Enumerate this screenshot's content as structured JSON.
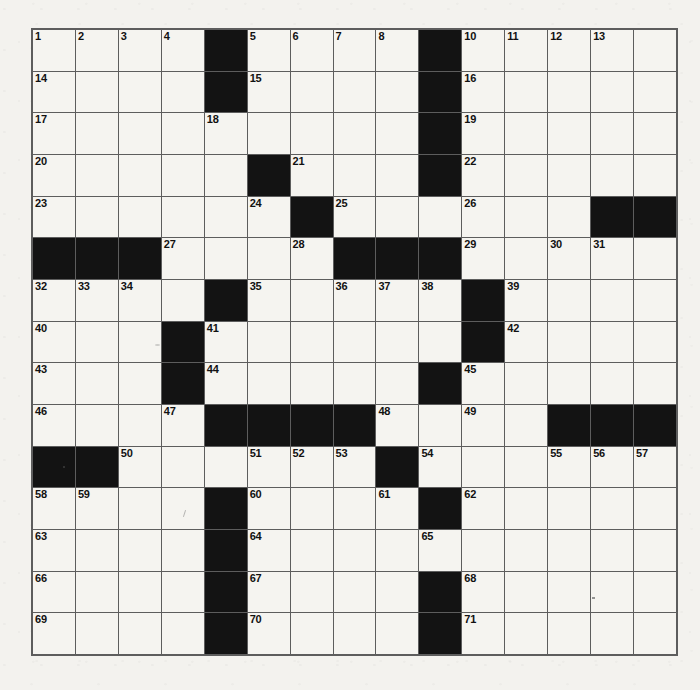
{
  "puzzle": {
    "name": "crossword-grid",
    "type": "crossword",
    "rows": 15,
    "cols": 15,
    "colors": {
      "block": "#131313",
      "cell": "#f5f4f0",
      "grid_line": "#5d5d5d",
      "paper": "#f3f2ee",
      "number_text": "#111111"
    },
    "blocks": [
      [
        0,
        4
      ],
      [
        0,
        9
      ],
      [
        1,
        4
      ],
      [
        1,
        9
      ],
      [
        2,
        9
      ],
      [
        3,
        5
      ],
      [
        3,
        9
      ],
      [
        4,
        6
      ],
      [
        4,
        13
      ],
      [
        4,
        14
      ],
      [
        5,
        0
      ],
      [
        5,
        1
      ],
      [
        5,
        2
      ],
      [
        5,
        7
      ],
      [
        5,
        8
      ],
      [
        5,
        9
      ],
      [
        6,
        4
      ],
      [
        6,
        10
      ],
      [
        7,
        3
      ],
      [
        7,
        10
      ],
      [
        8,
        3
      ],
      [
        8,
        9
      ],
      [
        9,
        4
      ],
      [
        9,
        5
      ],
      [
        9,
        6
      ],
      [
        9,
        7
      ],
      [
        9,
        12
      ],
      [
        9,
        13
      ],
      [
        9,
        14
      ],
      [
        10,
        0
      ],
      [
        10,
        1
      ],
      [
        10,
        8
      ],
      [
        11,
        4
      ],
      [
        11,
        9
      ],
      [
        12,
        4
      ],
      [
        13,
        4
      ],
      [
        13,
        9
      ],
      [
        14,
        4
      ],
      [
        14,
        9
      ]
    ],
    "numbers": [
      {
        "r": 0,
        "c": 0,
        "n": "1"
      },
      {
        "r": 0,
        "c": 1,
        "n": "2"
      },
      {
        "r": 0,
        "c": 2,
        "n": "3"
      },
      {
        "r": 0,
        "c": 3,
        "n": "4"
      },
      {
        "r": 0,
        "c": 5,
        "n": "5"
      },
      {
        "r": 0,
        "c": 6,
        "n": "6"
      },
      {
        "r": 0,
        "c": 7,
        "n": "7"
      },
      {
        "r": 0,
        "c": 8,
        "n": "8"
      },
      {
        "r": 0,
        "c": 9,
        "n": "9"
      },
      {
        "r": 0,
        "c": 10,
        "n": "10"
      },
      {
        "r": 0,
        "c": 11,
        "n": "11"
      },
      {
        "r": 0,
        "c": 12,
        "n": "12"
      },
      {
        "r": 0,
        "c": 13,
        "n": "13"
      },
      {
        "r": 1,
        "c": 0,
        "n": "14"
      },
      {
        "r": 1,
        "c": 5,
        "n": "15"
      },
      {
        "r": 1,
        "c": 10,
        "n": "16"
      },
      {
        "r": 2,
        "c": 0,
        "n": "17"
      },
      {
        "r": 2,
        "c": 4,
        "n": "18"
      },
      {
        "r": 2,
        "c": 10,
        "n": "19"
      },
      {
        "r": 3,
        "c": 0,
        "n": "20"
      },
      {
        "r": 3,
        "c": 6,
        "n": "21"
      },
      {
        "r": 3,
        "c": 10,
        "n": "22"
      },
      {
        "r": 4,
        "c": 0,
        "n": "23"
      },
      {
        "r": 4,
        "c": 5,
        "n": "24"
      },
      {
        "r": 4,
        "c": 7,
        "n": "25"
      },
      {
        "r": 4,
        "c": 10,
        "n": "26"
      },
      {
        "r": 5,
        "c": 3,
        "n": "27"
      },
      {
        "r": 5,
        "c": 6,
        "n": "28"
      },
      {
        "r": 5,
        "c": 10,
        "n": "29"
      },
      {
        "r": 5,
        "c": 12,
        "n": "30"
      },
      {
        "r": 5,
        "c": 13,
        "n": "31"
      },
      {
        "r": 6,
        "c": 0,
        "n": "32"
      },
      {
        "r": 6,
        "c": 1,
        "n": "33"
      },
      {
        "r": 6,
        "c": 2,
        "n": "34"
      },
      {
        "r": 6,
        "c": 5,
        "n": "35"
      },
      {
        "r": 6,
        "c": 7,
        "n": "36"
      },
      {
        "r": 6,
        "c": 8,
        "n": "37"
      },
      {
        "r": 6,
        "c": 9,
        "n": "38"
      },
      {
        "r": 6,
        "c": 11,
        "n": "39"
      },
      {
        "r": 7,
        "c": 0,
        "n": "40"
      },
      {
        "r": 7,
        "c": 4,
        "n": "41"
      },
      {
        "r": 7,
        "c": 11,
        "n": "42"
      },
      {
        "r": 8,
        "c": 0,
        "n": "43"
      },
      {
        "r": 8,
        "c": 4,
        "n": "44"
      },
      {
        "r": 8,
        "c": 10,
        "n": "45"
      },
      {
        "r": 9,
        "c": 0,
        "n": "46"
      },
      {
        "r": 9,
        "c": 3,
        "n": "47"
      },
      {
        "r": 9,
        "c": 8,
        "n": "48"
      },
      {
        "r": 9,
        "c": 10,
        "n": "49"
      },
      {
        "r": 10,
        "c": 2,
        "n": "50"
      },
      {
        "r": 10,
        "c": 5,
        "n": "51"
      },
      {
        "r": 10,
        "c": 6,
        "n": "52"
      },
      {
        "r": 10,
        "c": 7,
        "n": "53"
      },
      {
        "r": 10,
        "c": 9,
        "n": "54"
      },
      {
        "r": 10,
        "c": 12,
        "n": "55"
      },
      {
        "r": 10,
        "c": 13,
        "n": "56"
      },
      {
        "r": 10,
        "c": 14,
        "n": "57"
      },
      {
        "r": 11,
        "c": 0,
        "n": "58"
      },
      {
        "r": 11,
        "c": 1,
        "n": "59"
      },
      {
        "r": 11,
        "c": 5,
        "n": "60"
      },
      {
        "r": 11,
        "c": 8,
        "n": "61"
      },
      {
        "r": 11,
        "c": 10,
        "n": "62"
      },
      {
        "r": 12,
        "c": 0,
        "n": "63"
      },
      {
        "r": 12,
        "c": 5,
        "n": "64"
      },
      {
        "r": 12,
        "c": 9,
        "n": "65"
      },
      {
        "r": 13,
        "c": 0,
        "n": "66"
      },
      {
        "r": 13,
        "c": 5,
        "n": "67"
      },
      {
        "r": 13,
        "c": 10,
        "n": "68"
      },
      {
        "r": 14,
        "c": 0,
        "n": "69"
      },
      {
        "r": 14,
        "c": 5,
        "n": "70"
      },
      {
        "r": 14,
        "c": 10,
        "n": "71"
      }
    ],
    "entries": []
  }
}
